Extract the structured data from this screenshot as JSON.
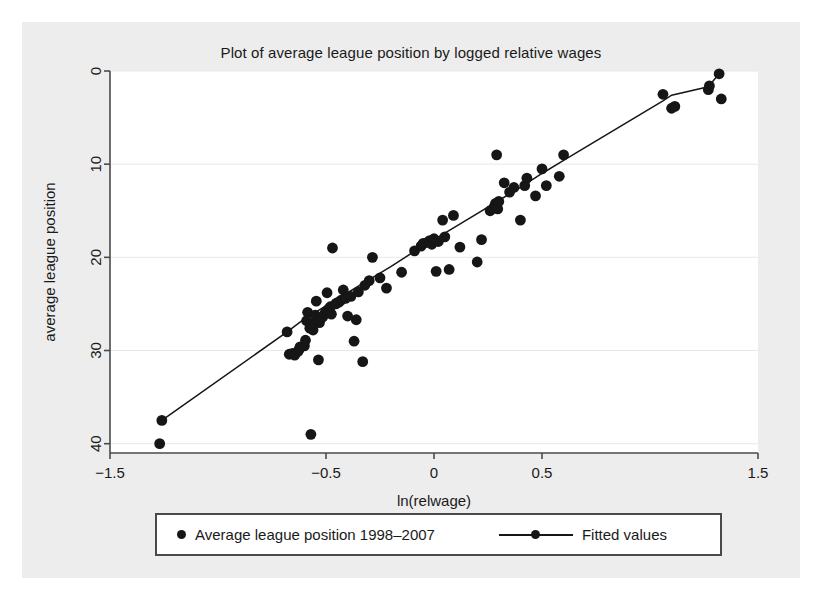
{
  "figure": {
    "background": "#ededed",
    "plot_background": "#ffffff",
    "marker_color": "#161616",
    "line_color": "#161616",
    "grid_color": "#e8e8e8",
    "axis_color": "#4a4a4a"
  },
  "legend": {
    "scatter_label": "Average league position 1998–2007",
    "fit_label": "Fitted values"
  },
  "chart_data": {
    "type": "scatter",
    "title": "Plot of average league position by logged relative wages",
    "xlabel": "ln(relwage)",
    "ylabel": "average league position",
    "xlim": [
      -1.5,
      1.5
    ],
    "ylim": [
      0,
      41
    ],
    "y_inverted": true,
    "grid": true,
    "grid_axis": "y",
    "legend_position": "below-plot",
    "xticks": [
      -1.5,
      -0.5,
      0,
      0.5,
      1.5
    ],
    "xticklabels": [
      "-1.5",
      "-0.5",
      "0",
      "0.5",
      "1.5"
    ],
    "yticks": [
      0,
      10,
      20,
      30,
      40
    ],
    "yticklabels": [
      "0",
      "10",
      "20",
      "30",
      "40"
    ],
    "series": [
      {
        "name": "Average league position 1998–2007",
        "type": "scatter",
        "marker": "circle",
        "points": [
          [
            -1.27,
            40.0
          ],
          [
            -1.26,
            37.5
          ],
          [
            -0.68,
            28.0
          ],
          [
            -0.67,
            30.4
          ],
          [
            -0.655,
            30.3
          ],
          [
            -0.645,
            30.5
          ],
          [
            -0.63,
            30.1
          ],
          [
            -0.625,
            29.9
          ],
          [
            -0.62,
            29.6
          ],
          [
            -0.6,
            29.5
          ],
          [
            -0.595,
            28.9
          ],
          [
            -0.59,
            26.8
          ],
          [
            -0.585,
            25.9
          ],
          [
            -0.575,
            27.6
          ],
          [
            -0.57,
            39.0
          ],
          [
            -0.56,
            27.8
          ],
          [
            -0.555,
            27.1
          ],
          [
            -0.55,
            26.2
          ],
          [
            -0.545,
            24.7
          ],
          [
            -0.535,
            31.0
          ],
          [
            -0.53,
            27.0
          ],
          [
            -0.525,
            26.5
          ],
          [
            -0.515,
            26.4
          ],
          [
            -0.505,
            26.0
          ],
          [
            -0.5,
            25.8
          ],
          [
            -0.495,
            23.8
          ],
          [
            -0.49,
            25.6
          ],
          [
            -0.485,
            25.5
          ],
          [
            -0.48,
            25.3
          ],
          [
            -0.475,
            26.1
          ],
          [
            -0.47,
            19.0
          ],
          [
            -0.455,
            25.0
          ],
          [
            -0.45,
            24.9
          ],
          [
            -0.44,
            24.8
          ],
          [
            -0.43,
            24.6
          ],
          [
            -0.42,
            23.5
          ],
          [
            -0.41,
            24.4
          ],
          [
            -0.4,
            26.3
          ],
          [
            -0.385,
            24.2
          ],
          [
            -0.37,
            29.0
          ],
          [
            -0.36,
            26.7
          ],
          [
            -0.35,
            23.7
          ],
          [
            -0.33,
            31.2
          ],
          [
            -0.32,
            23.0
          ],
          [
            -0.3,
            22.5
          ],
          [
            -0.285,
            20.0
          ],
          [
            -0.25,
            22.2
          ],
          [
            -0.22,
            23.3
          ],
          [
            -0.15,
            21.6
          ],
          [
            -0.09,
            19.3
          ],
          [
            -0.06,
            18.8
          ],
          [
            -0.05,
            18.5
          ],
          [
            -0.03,
            18.4
          ],
          [
            -0.02,
            18.2
          ],
          [
            -0.01,
            18.6
          ],
          [
            0.0,
            18.0
          ],
          [
            0.01,
            21.5
          ],
          [
            0.02,
            18.3
          ],
          [
            0.04,
            16.0
          ],
          [
            0.05,
            17.8
          ],
          [
            0.07,
            21.3
          ],
          [
            0.09,
            15.5
          ],
          [
            0.12,
            18.9
          ],
          [
            0.2,
            20.5
          ],
          [
            0.22,
            18.1
          ],
          [
            0.26,
            15.0
          ],
          [
            0.28,
            14.5
          ],
          [
            0.285,
            14.2
          ],
          [
            0.29,
            9.0
          ],
          [
            0.295,
            14.8
          ],
          [
            0.3,
            14.0
          ],
          [
            0.325,
            12.0
          ],
          [
            0.35,
            13.0
          ],
          [
            0.37,
            12.5
          ],
          [
            0.4,
            16.0
          ],
          [
            0.42,
            12.3
          ],
          [
            0.43,
            11.5
          ],
          [
            0.47,
            13.4
          ],
          [
            0.5,
            10.5
          ],
          [
            0.52,
            12.3
          ],
          [
            0.58,
            11.3
          ],
          [
            0.6,
            9.0
          ],
          [
            1.06,
            2.5
          ],
          [
            1.1,
            4.0
          ],
          [
            1.115,
            3.8
          ],
          [
            1.27,
            2.0
          ],
          [
            1.275,
            1.6
          ],
          [
            1.32,
            0.3
          ],
          [
            1.33,
            3.0
          ]
        ]
      },
      {
        "name": "Fitted values",
        "type": "line",
        "points": [
          [
            -1.26,
            37.5
          ],
          [
            -0.68,
            28.0
          ],
          [
            -0.6,
            26.6
          ],
          [
            -0.5,
            25.2
          ],
          [
            -0.4,
            23.8
          ],
          [
            -0.3,
            22.4
          ],
          [
            -0.2,
            21.0
          ],
          [
            -0.1,
            19.5
          ],
          [
            0.0,
            18.1
          ],
          [
            0.1,
            16.7
          ],
          [
            0.2,
            15.3
          ],
          [
            0.3,
            13.9
          ],
          [
            0.4,
            12.5
          ],
          [
            0.5,
            11.0
          ],
          [
            0.6,
            9.6
          ],
          [
            1.06,
            3.2
          ],
          [
            1.1,
            2.6
          ],
          [
            1.27,
            1.7
          ],
          [
            1.32,
            0.3
          ]
        ]
      }
    ]
  }
}
